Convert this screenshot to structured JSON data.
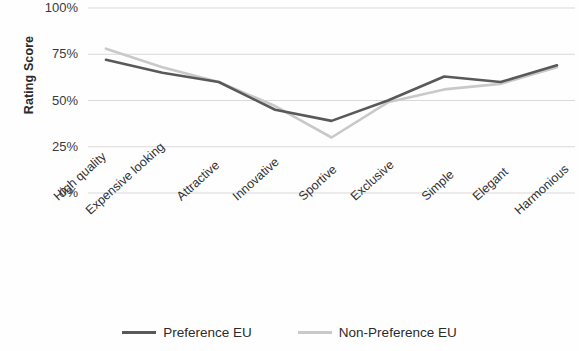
{
  "chart_data": {
    "type": "line",
    "title": "",
    "subtitle": "",
    "xlabel": "",
    "ylabel": "Rating Score",
    "categories": [
      "High quality",
      "Expensive looking",
      "Attractive",
      "Innovative",
      "Sportive",
      "Exclusive",
      "Simple",
      "Elegant",
      "Harmonious"
    ],
    "series": [
      {
        "name": "Preference EU",
        "color": "#595959",
        "values": [
          72,
          65,
          60,
          45,
          39,
          50,
          63,
          60,
          69
        ]
      },
      {
        "name": "Non-Preference EU",
        "color": "#c9c9c9",
        "values": [
          78,
          68,
          60,
          47,
          30,
          49,
          56,
          59,
          68
        ]
      }
    ],
    "ylim": [
      0,
      100
    ],
    "ytick_values": [
      100,
      75,
      50,
      25,
      0
    ],
    "ytick_labels": [
      "100%",
      "75%",
      "50%",
      "25%",
      "0%"
    ],
    "grid": true,
    "grid_axis": "y",
    "grid_color": "#d9d9d9",
    "legend_position": "bottom",
    "markers": false,
    "x_label_rotation": -42
  }
}
